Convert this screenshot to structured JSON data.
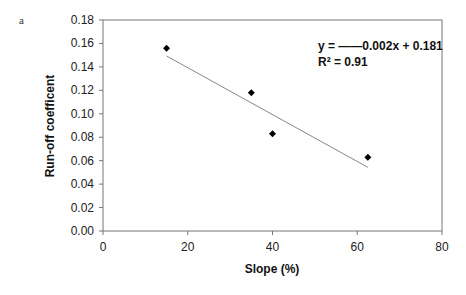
{
  "panel_label": "a",
  "chart_data": {
    "type": "scatter",
    "title": "",
    "xlabel": "Slope (%)",
    "ylabel": "Run-off coefficent",
    "xlim": [
      0,
      80
    ],
    "ylim": [
      0,
      0.18
    ],
    "x_ticks": [
      "0",
      "20",
      "40",
      "60",
      "80"
    ],
    "y_ticks": [
      "0.00",
      "0.02",
      "0.04",
      "0.06",
      "0.08",
      "0.10",
      "0.12",
      "0.14",
      "0.16",
      "0.18"
    ],
    "grid": false,
    "legend": "none",
    "series": [
      {
        "name": "observations",
        "marker": "diamond",
        "x": [
          15,
          35,
          40,
          62.5
        ],
        "y": [
          0.156,
          0.118,
          0.083,
          0.063
        ]
      }
    ],
    "trendline": {
      "type": "linear",
      "slope": -0.002,
      "intercept": 0.181,
      "x_range": [
        15,
        62.5
      ],
      "equation": "y = ——0.002x + 0.181",
      "r_squared": "R² = 0.91"
    }
  }
}
